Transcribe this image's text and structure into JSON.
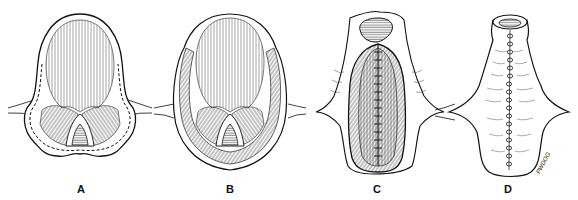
{
  "figure": {
    "panels": [
      {
        "id": "A",
        "label": "A"
      },
      {
        "id": "B",
        "label": "B"
      },
      {
        "id": "C",
        "label": "C"
      },
      {
        "id": "D",
        "label": "D"
      }
    ],
    "signature": "PWDOG",
    "colors": {
      "ink": "#111111",
      "background": "#ffffff"
    }
  }
}
